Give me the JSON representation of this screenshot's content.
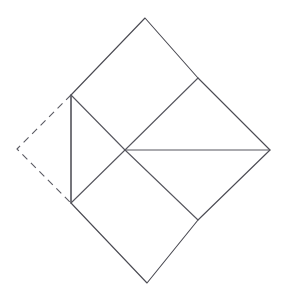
{
  "figure": {
    "background_color": "#ffffff",
    "stroke_color": "#4a4a52",
    "dashed_stroke_color": "#5a5a62",
    "stroke_width": 1.1,
    "dash_pattern": "7 5",
    "canvas": {
      "width": 284,
      "height": 299
    },
    "vertices": {
      "top": {
        "x": 145,
        "y": 18
      },
      "upper_left": {
        "x": 71,
        "y": 95
      },
      "lower_left": {
        "x": 71,
        "y": 203
      },
      "bottom": {
        "x": 147,
        "y": 283
      },
      "lower_right_inner": {
        "x": 198,
        "y": 220
      },
      "right": {
        "x": 270,
        "y": 150
      },
      "upper_right_inner": {
        "x": 198,
        "y": 78
      },
      "center": {
        "x": 125,
        "y": 150
      },
      "dashed_apex": {
        "x": 17,
        "y": 149
      }
    },
    "paths": {
      "outline_solid": "M 145,18 L 71,95 L 71,203 L 147,283 L 198,220 L 270,150 L 198,78 Z",
      "dashed_flap": "M 71,95 L 17,149 L 71,203",
      "vertical_chord": "M 71,95 L 71,203",
      "spoke_upper_left": "M 71,95 L 125,150",
      "spoke_lower_left": "M 71,203 L 125,150",
      "spoke_upper_right": "M 198,78 L 125,150",
      "spoke_lower_right": "M 198,220 L 125,150",
      "spoke_right_horizontal": "M 125,150 L 270,150"
    }
  }
}
